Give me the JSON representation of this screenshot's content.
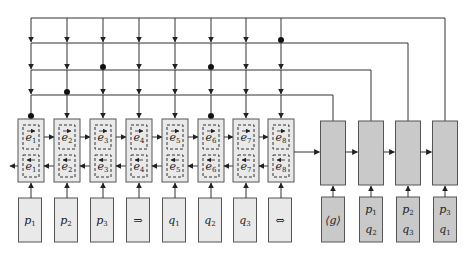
{
  "diagram": {
    "colors": {
      "encoder_fill": "#e9e9e9",
      "decoder_fill": "#c9c9c9",
      "stroke": "#555555",
      "line": "#333333"
    },
    "encoder": {
      "columns": [
        {
          "x": 31,
          "forward": "e1",
          "backward": "e1",
          "input": "p1"
        },
        {
          "x": 67,
          "forward": "e2",
          "backward": "e2",
          "input": "p2"
        },
        {
          "x": 103,
          "forward": "e3",
          "backward": "e3",
          "input": "p3"
        },
        {
          "x": 139,
          "forward": "e4",
          "backward": "e4",
          "input": "⇒"
        },
        {
          "x": 175,
          "forward": "e5",
          "backward": "e5",
          "input": "q1"
        },
        {
          "x": 211,
          "forward": "e6",
          "backward": "e6",
          "input": "q2"
        },
        {
          "x": 246,
          "forward": "e7",
          "backward": "e7",
          "input": "q3"
        },
        {
          "x": 281,
          "forward": "e8",
          "backward": "e8",
          "input": "⇔"
        }
      ]
    },
    "decoder": {
      "columns": [
        {
          "x": 333,
          "input_lines": [
            "⟨g⟩"
          ]
        },
        {
          "x": 371,
          "input_lines": [
            "p1",
            "q2"
          ]
        },
        {
          "x": 408,
          "input_lines": [
            "p2",
            "q3"
          ]
        },
        {
          "x": 445,
          "input_lines": [
            "p3",
            "q1"
          ]
        }
      ]
    },
    "attention_rows": [
      {
        "y": 18,
        "decoder_x": 445,
        "dot_columns": [
          8
        ]
      },
      {
        "y": 43,
        "decoder_x": 408,
        "dot_columns": [
          3,
          6
        ]
      },
      {
        "y": 70,
        "decoder_x": 371,
        "dot_columns": [
          2
        ]
      },
      {
        "y": 95,
        "decoder_x": 333,
        "dot_columns": [
          1,
          6
        ]
      }
    ]
  }
}
